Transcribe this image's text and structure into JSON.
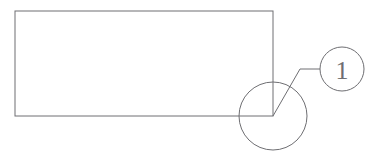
{
  "drawing": {
    "title": "Detail callout drawing",
    "background_color": "#ffffff",
    "line_color": "#6e6e72",
    "line_width": 1,
    "canvas": {
      "width": 376,
      "height": 165
    }
  },
  "part_outline": {
    "shape": "rectangle",
    "x": 15,
    "y": 11,
    "width": 258,
    "height": 105,
    "stroke": "#6e6e72"
  },
  "detail_circle": {
    "center_x": 273,
    "center_y": 116,
    "radius": 34,
    "stroke": "#6e6e72",
    "fill": "none"
  },
  "leader": {
    "start_x": 273,
    "start_y": 116,
    "bend_x": 300,
    "bend_y": 69,
    "end_x": 320,
    "end_y": 69,
    "stroke": "#6e6e72"
  },
  "balloon": {
    "center_x": 342,
    "center_y": 69,
    "radius": 22,
    "stroke": "#6e6e72",
    "fill": "none",
    "label": "1"
  }
}
